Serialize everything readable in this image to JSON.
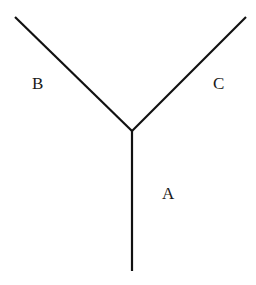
{
  "diagram": {
    "type": "Y-shaped junction",
    "branches": [
      {
        "label": "A",
        "description": "vertical stem going down from junction"
      },
      {
        "label": "B",
        "description": "upper-left arm"
      },
      {
        "label": "C",
        "description": "upper-right arm"
      }
    ],
    "colors": {
      "line": "#111111",
      "text": "#1a1a1a",
      "background": "#ffffff"
    }
  }
}
